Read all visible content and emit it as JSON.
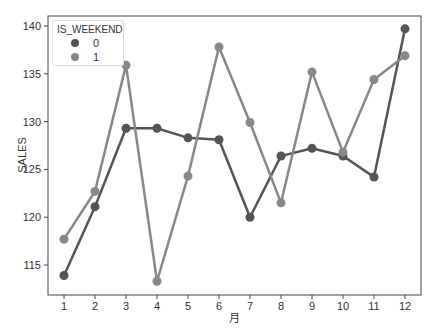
{
  "chart_data": {
    "type": "line",
    "title": "",
    "xlabel": "月",
    "ylabel": "SALES",
    "categories": [
      "1",
      "2",
      "3",
      "4",
      "5",
      "6",
      "7",
      "8",
      "9",
      "10",
      "11",
      "12"
    ],
    "yticks": [
      115,
      120,
      125,
      130,
      135,
      140
    ],
    "ylim": [
      112,
      141.5
    ],
    "grid": false,
    "legend": {
      "title": "IS_WEEKEND",
      "position": "upper left"
    },
    "series": [
      {
        "name": "0",
        "color": "#555555",
        "values": [
          113.9,
          121.1,
          129.3,
          129.3,
          128.3,
          128.1,
          120.0,
          126.4,
          127.2,
          126.4,
          124.2,
          139.7
        ]
      },
      {
        "name": "1",
        "color": "#888888",
        "values": [
          117.7,
          122.7,
          135.9,
          113.3,
          124.3,
          137.8,
          129.9,
          121.5,
          135.2,
          126.8,
          134.4,
          136.9
        ]
      }
    ]
  }
}
